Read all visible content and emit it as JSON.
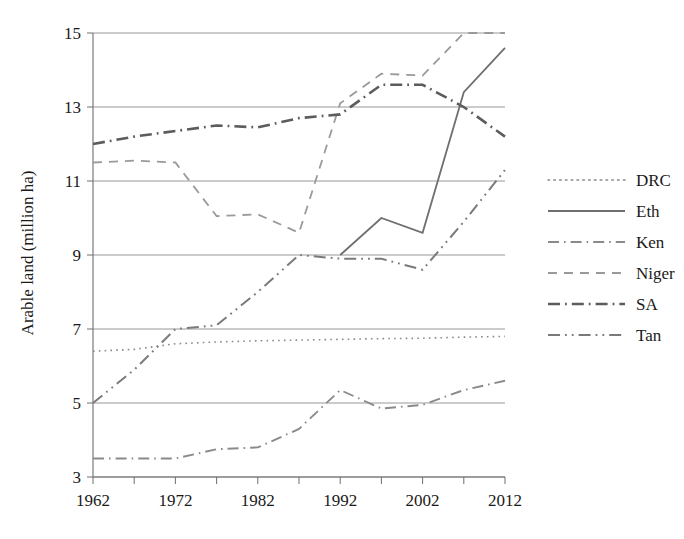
{
  "chart_data": {
    "type": "line",
    "title": "",
    "xlabel": "",
    "ylabel": "Arable land (million ha)",
    "xlim": [
      1962,
      2012
    ],
    "ylim": [
      3,
      15
    ],
    "yticks": [
      3,
      5,
      7,
      9,
      11,
      13,
      15
    ],
    "ytick_labels": [
      "3",
      "5",
      "7",
      "9",
      "11",
      "13",
      "15"
    ],
    "xticks": [
      1962,
      1967,
      1972,
      1977,
      1982,
      1987,
      1992,
      1997,
      2002,
      2007,
      2012
    ],
    "xtick_labels": [
      "1962",
      "",
      "1972",
      "",
      "1982",
      "",
      "1992",
      "",
      "2002",
      "",
      "2012"
    ],
    "xtick_labels_shown": [
      "1962",
      "1972",
      "1982",
      "1992",
      "2002",
      "2012"
    ],
    "grid": "horizontal",
    "legend_position": "right",
    "x": [
      1962,
      1967,
      1972,
      1977,
      1982,
      1987,
      1992,
      1997,
      2002,
      2007,
      2012
    ],
    "series": [
      {
        "name": "DRC",
        "label": "DRC",
        "dash_style": "dotted",
        "color": "#8a8a8a",
        "width": 1.6,
        "values": [
          6.4,
          6.45,
          6.6,
          6.65,
          6.68,
          6.7,
          6.72,
          6.74,
          6.75,
          6.78,
          6.8
        ]
      },
      {
        "name": "Eth",
        "label": "Eth",
        "dash_style": "solid",
        "color": "#6f6f6f",
        "width": 1.8,
        "values": [
          null,
          null,
          null,
          null,
          null,
          null,
          9.0,
          10.0,
          9.6,
          13.4,
          14.6
        ]
      },
      {
        "name": "Ken",
        "label": "Ken",
        "dash_style": "dash-dot",
        "color": "#8a8a8a",
        "width": 1.9,
        "values": [
          3.5,
          3.5,
          3.5,
          3.75,
          3.8,
          4.3,
          5.35,
          4.85,
          4.95,
          5.35,
          5.6
        ]
      },
      {
        "name": "Niger",
        "label": "Niger",
        "dash_style": "dashed",
        "color": "#9a9a9a",
        "width": 1.8,
        "values": [
          11.5,
          11.55,
          11.5,
          10.05,
          10.1,
          9.6,
          13.1,
          13.9,
          13.85,
          15.0,
          15.0
        ]
      },
      {
        "name": "SA",
        "label": "SA",
        "dash_style": "dash-dot-bold",
        "color": "#5c5c5c",
        "width": 2.6,
        "values": [
          12.0,
          12.2,
          12.35,
          12.5,
          12.45,
          12.7,
          12.8,
          13.6,
          13.6,
          13.0,
          12.2
        ]
      },
      {
        "name": "Tan",
        "label": "Tan",
        "dash_style": "dash-dot-dot",
        "color": "#7a7a7a",
        "width": 2.0,
        "values": [
          5.0,
          5.9,
          7.0,
          7.1,
          8.0,
          9.0,
          8.9,
          8.9,
          8.6,
          9.9,
          11.3
        ]
      }
    ]
  },
  "legend": {
    "entries": [
      {
        "label": "DRC"
      },
      {
        "label": "Eth"
      },
      {
        "label": "Ken"
      },
      {
        "label": "Niger"
      },
      {
        "label": "SA"
      },
      {
        "label": "Tan"
      }
    ]
  }
}
